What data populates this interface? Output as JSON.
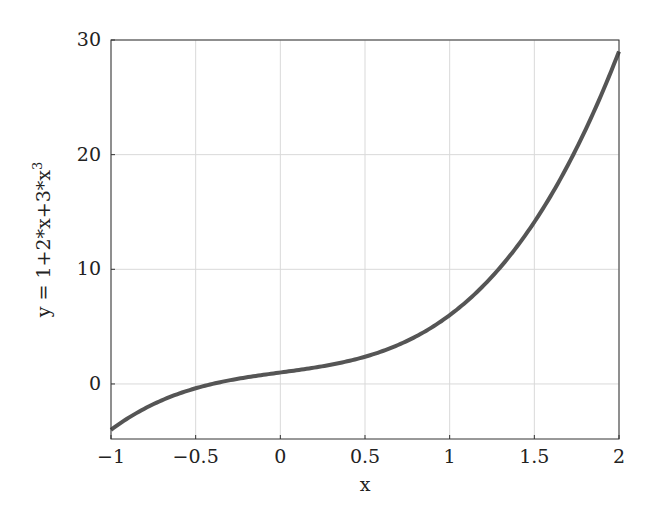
{
  "chart_data": {
    "type": "line",
    "title": "",
    "xlabel": "x",
    "ylabel": "y = 1+2*x+3*x^3",
    "ylabel_parts": {
      "base": "y = 1+2*x+3*x",
      "sup": "3"
    },
    "xlim": [
      -1,
      2
    ],
    "ylim": [
      -4.8,
      30
    ],
    "grid": true,
    "legend": null,
    "x_ticks": [
      -1,
      -0.5,
      0,
      0.5,
      1,
      1.5,
      2
    ],
    "x_tick_labels": [
      "−1",
      "−0.5",
      "0",
      "0.5",
      "1",
      "1.5",
      "2"
    ],
    "y_ticks": [
      0,
      10,
      20,
      30
    ],
    "y_tick_labels": [
      "0",
      "10",
      "20",
      "30"
    ],
    "series": [
      {
        "name": "y = 1+2*x+3*x^3",
        "color": "#555555",
        "x": [
          -1,
          -0.75,
          -0.5,
          -0.25,
          0,
          0.25,
          0.5,
          0.75,
          1,
          1.25,
          1.5,
          1.75,
          2
        ],
        "values": [
          -4,
          -1.77,
          -0.38,
          0.45,
          1,
          1.55,
          2.38,
          3.77,
          6,
          9.36,
          14.13,
          20.58,
          29
        ]
      }
    ]
  },
  "style": {
    "line_color": "#555555",
    "grid_color": "#d9d9d9",
    "axis_color": "#333333"
  }
}
